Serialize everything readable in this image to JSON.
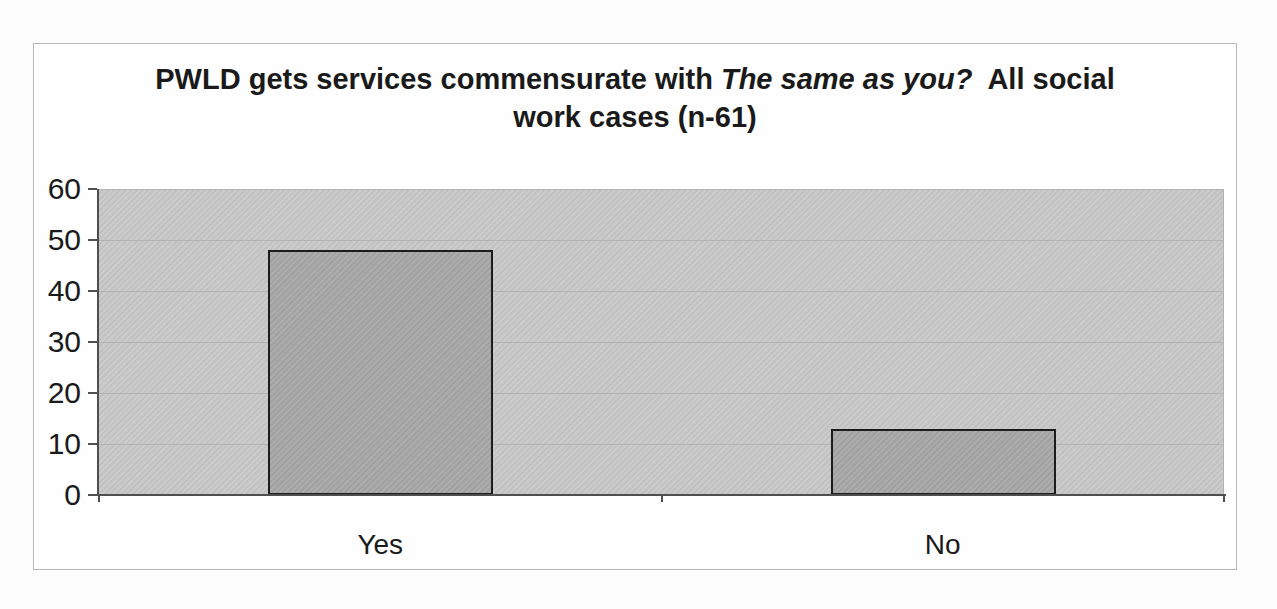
{
  "chart_title": {
    "line1_prefix": "PWLD gets services commensurate with ",
    "line1_italic": "The same as you?",
    "line1_suffix": "  All social",
    "line2": "work cases (n-61)"
  },
  "chart_data": {
    "type": "bar",
    "title": "PWLD gets services commensurate with The same as you?  All social work cases (n-61)",
    "categories": [
      "Yes",
      "No"
    ],
    "values": [
      48,
      13
    ],
    "xlabel": "",
    "ylabel": "",
    "ylim": [
      0,
      60
    ],
    "yticks": [
      0,
      10,
      20,
      30,
      40,
      50,
      60
    ],
    "grid": "horizontal-gridlines",
    "legend": "none"
  },
  "colors": {
    "plot_bg": "#c8c8c8",
    "bar_fill": "#a8a8a8",
    "bar_border": "#1c1c1c",
    "gridline": "#b2b2b2",
    "axis": "#4f4f4f",
    "frame_border": "#b8b8b8",
    "text": "#1a1a1a",
    "background": "#fdfdfd"
  }
}
